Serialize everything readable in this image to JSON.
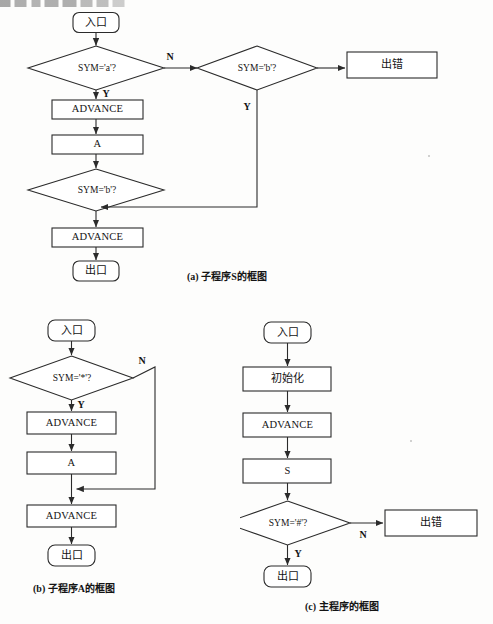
{
  "page": {
    "width": 493,
    "height": 624,
    "background": "#fdfdfc",
    "ink_color": "#2b2b2b",
    "truncated_header_line": ""
  },
  "diagrams": [
    {
      "id": "subroutine-s",
      "caption": "(a) 子程序S的框图",
      "nodes": {
        "entry": "入口",
        "cond_a": "SYM='a'?",
        "cond_b_right": "SYM='b'?",
        "error": "出错",
        "advance1": "ADVANCE",
        "call_a": "A",
        "cond_b_low": "SYM='b'?",
        "advance2": "ADVANCE",
        "exit": "出口"
      },
      "edge_labels": {
        "a_no": "N",
        "a_yes": "Y",
        "b_right_yes": "Y"
      }
    },
    {
      "id": "subroutine-a",
      "caption": "(b) 子程序A的框图",
      "nodes": {
        "entry": "入口",
        "cond_star": "SYM='*'?",
        "advance1": "ADVANCE",
        "call_a": "A",
        "advance2": "ADVANCE",
        "exit": "出口"
      },
      "edge_labels": {
        "star_no": "N",
        "star_yes": "Y"
      }
    },
    {
      "id": "main-program",
      "caption": "(c) 主程序的框图",
      "nodes": {
        "entry": "入口",
        "init": "初始化",
        "advance1": "ADVANCE",
        "call_s": "S",
        "cond_hash": "SYM='#'?",
        "error": "出错",
        "exit": "出口"
      },
      "edge_labels": {
        "hash_no": "N",
        "hash_yes": "Y"
      }
    }
  ]
}
